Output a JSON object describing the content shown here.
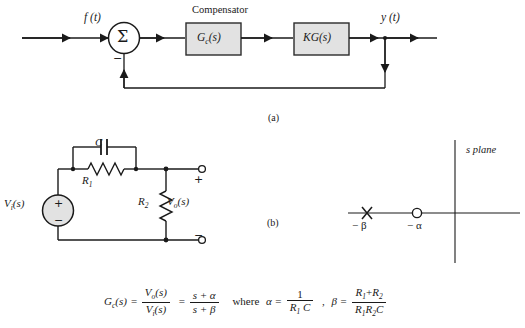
{
  "figure": {
    "caption_a": "(a)",
    "caption_b": "(b)"
  },
  "block_diagram": {
    "title": "Compensator",
    "input_signal": "f (t)",
    "output_signal": "y (t)",
    "summer_symbol": "Σ",
    "summer_sign": "−",
    "blocks": [
      {
        "name": "compensator-block",
        "label_main": "G",
        "label_sub": "c",
        "label_arg": "(s)"
      },
      {
        "name": "plant-block",
        "label_main": "KG",
        "label_sub": "",
        "label_arg": "(s)"
      }
    ]
  },
  "circuit": {
    "source_label_main": "V",
    "source_label_sub": "i",
    "source_label_arg": "(s)",
    "source_plus": "+",
    "source_minus": "−",
    "capacitor_label": "C",
    "resistor1_label_main": "R",
    "resistor1_label_sub": "1",
    "resistor2_label_main": "R",
    "resistor2_label_sub": "2",
    "output_label_main": "V",
    "output_label_sub": "o",
    "output_label_arg": "(s)",
    "terminal_plus": "+",
    "terminal_minus": "−"
  },
  "s_plane": {
    "title": "s  plane",
    "pole_marker": "×",
    "zero_marker": "○",
    "pole_label": "− β",
    "zero_label": "− α"
  },
  "equation": {
    "gc_main": "G",
    "gc_sub": "c",
    "gc_arg": "(s)",
    "eq1": "=",
    "frac1_num_main": "V",
    "frac1_num_sub": "o",
    "frac1_num_arg": "(s)",
    "frac1_den_main": "V",
    "frac1_den_sub": "i",
    "frac1_den_arg": "(s)",
    "eq2": "=",
    "frac2_num": "s + α",
    "frac2_den": "s + β",
    "where": "where",
    "alpha_sym": "α =",
    "alpha_num": "1",
    "alpha_den_main": "R",
    "alpha_den_sub": "1",
    "alpha_den_c": "C",
    "comma": ",",
    "beta_sym": "β =",
    "beta_num_r1": "R",
    "beta_num_sub1": "1",
    "beta_num_plus": "+",
    "beta_num_r2": "R",
    "beta_num_sub2": "2",
    "beta_den_r1": "R",
    "beta_den_sub1": "1",
    "beta_den_r2": "R",
    "beta_den_sub2": "2",
    "beta_den_c": "C"
  },
  "colors": {
    "line": "#1a1a1a",
    "block_fill": "#e2e2e2",
    "block_stroke": "#2b2b2b",
    "background": "#ffffff"
  }
}
